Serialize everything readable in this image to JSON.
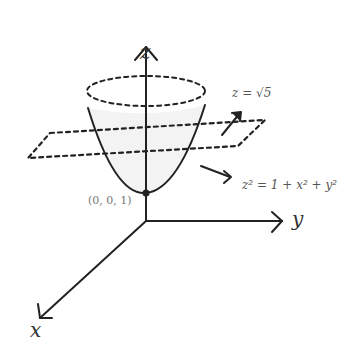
{
  "diagram": {
    "axes": {
      "x_label": "x",
      "y_label": "y",
      "z_label": "z"
    },
    "plane_label": "z = √5",
    "surface_label": "z² = 1 + x² + y²",
    "vertex_label": "(0, 0, 1)",
    "colors": {
      "stroke": "#222222",
      "fill": "#f3f3f3",
      "text": "#555555"
    }
  }
}
